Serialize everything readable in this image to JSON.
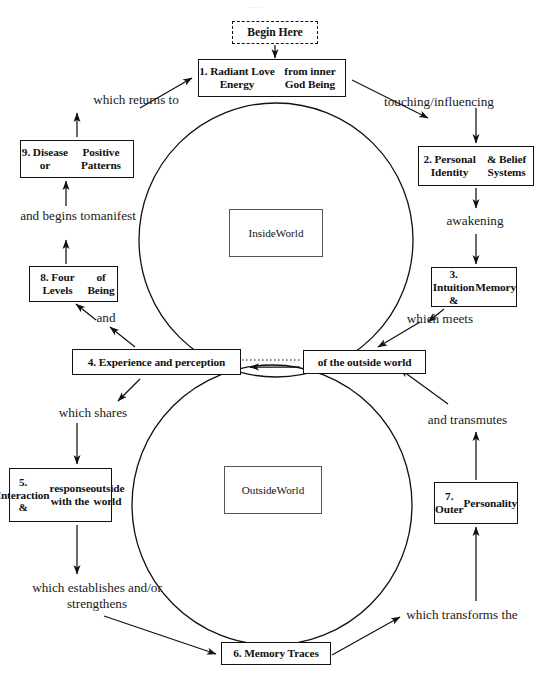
{
  "page": {
    "width": 541,
    "height": 676,
    "background": "#ffffff",
    "ink": "#111111",
    "faint_header": "....."
  },
  "diagram": {
    "type": "cycle-flow-diagram",
    "circles": [
      {
        "name": "inside-world-circle",
        "cx": 276,
        "cy": 240,
        "r": 137
      },
      {
        "name": "outside-world-circle",
        "cx": 272,
        "cy": 505,
        "r": 140
      }
    ],
    "center_labels": [
      {
        "id": "inside",
        "name": "inside-world-label",
        "text": "Inside\nWorld",
        "line1": "Inside",
        "line2": "World",
        "x": 229,
        "y": 209,
        "w": 94,
        "h": 48
      },
      {
        "id": "outside",
        "name": "outside-world-label",
        "text": "Outside\nWorld",
        "line1": "Outside",
        "line2": "World",
        "x": 224,
        "y": 466,
        "w": 98,
        "h": 48
      }
    ],
    "nodes": [
      {
        "id": "begin",
        "name": "begin-here-box",
        "label": "Begin Here",
        "style": "dashed",
        "x": 232,
        "y": 21,
        "w": 86,
        "h": 23
      },
      {
        "id": "n1",
        "name": "node-1-radiant-love-energy",
        "label": "1. Radiant Love Energy\nfrom inner God Being",
        "style": "solid",
        "x": 198,
        "y": 59,
        "w": 148,
        "h": 38
      },
      {
        "id": "n2",
        "name": "node-2-personal-identity",
        "label": "2. Personal Identity\n& Belief Systems",
        "style": "solid",
        "x": 418,
        "y": 146,
        "w": 116,
        "h": 40
      },
      {
        "id": "n3",
        "name": "node-3-intuition-memory",
        "label": "3. Intuition &\nMemory",
        "style": "solid",
        "x": 431,
        "y": 267,
        "w": 86,
        "h": 40
      },
      {
        "id": "outw",
        "name": "node-of-the-outside-world",
        "label": "of the outside world",
        "style": "solid",
        "x": 303,
        "y": 350,
        "w": 123,
        "h": 24
      },
      {
        "id": "n4",
        "name": "node-4-experience-perception",
        "label": "4. Experience and perception",
        "style": "solid",
        "x": 72,
        "y": 349,
        "w": 169,
        "h": 26
      },
      {
        "id": "n5",
        "name": "node-5-interaction-response",
        "label": "5. Interaction &\nresponse with the\noutside world",
        "style": "solid",
        "x": 9,
        "y": 468,
        "w": 103,
        "h": 54
      },
      {
        "id": "n6",
        "name": "node-6-memory-traces",
        "label": "6. Memory Traces",
        "style": "solid",
        "x": 221,
        "y": 642,
        "w": 110,
        "h": 23
      },
      {
        "id": "n7",
        "name": "node-7-outer-personality",
        "label": "7. Outer\nPersonality",
        "style": "solid",
        "x": 434,
        "y": 482,
        "w": 84,
        "h": 42
      },
      {
        "id": "n8",
        "name": "node-8-four-levels-of-being",
        "label": "8. Four Levels\nof Being",
        "style": "solid",
        "x": 29,
        "y": 266,
        "w": 89,
        "h": 36
      },
      {
        "id": "n9",
        "name": "node-9-disease-positive",
        "label": "9. Disease or\nPositive Patterns",
        "style": "solid",
        "x": 20,
        "y": 140,
        "w": 114,
        "h": 38
      }
    ],
    "connector_labels": [
      {
        "id": "c1",
        "name": "connector-label-touching-influencing",
        "text": "touching/influencing",
        "x": 364,
        "y": 94,
        "w": 150
      },
      {
        "id": "c2",
        "name": "connector-label-awakening",
        "text": "awakening",
        "x": 425,
        "y": 213,
        "w": 100
      },
      {
        "id": "c3",
        "name": "connector-label-which-meets",
        "text": "which meets",
        "x": 385,
        "y": 311,
        "w": 110
      },
      {
        "id": "c4",
        "name": "connector-label-and-transmutes",
        "text": "and transmutes",
        "x": 405,
        "y": 412,
        "w": 125
      },
      {
        "id": "c5",
        "name": "connector-label-which-transforms-the",
        "text": "which transforms the",
        "x": 382,
        "y": 607,
        "w": 160
      },
      {
        "id": "c6",
        "name": "connector-label-which-establishes",
        "text": "which establishes and/\nor strengthens",
        "x": 6,
        "y": 580,
        "w": 182
      },
      {
        "id": "c7",
        "name": "connector-label-which-shares",
        "text": "which shares",
        "x": 33,
        "y": 405,
        "w": 120
      },
      {
        "id": "c8",
        "name": "connector-label-and",
        "text": "and",
        "x": 86,
        "y": 310,
        "w": 40
      },
      {
        "id": "c9",
        "name": "connector-label-and-begins-to-manifest",
        "text": "and begins to\nmanifest",
        "x": 18,
        "y": 208,
        "w": 120
      },
      {
        "id": "c10",
        "name": "connector-label-which-returns-to",
        "text": "which returns to",
        "x": 66,
        "y": 92,
        "w": 140
      }
    ],
    "arrows": [
      {
        "name": "arrow-begin-to-node1",
        "from": "begin",
        "to": "n1"
      },
      {
        "name": "arrow-node1-to-touching",
        "from": "n1",
        "to": "c1"
      },
      {
        "name": "arrow-touching-to-node2",
        "from": "c1",
        "to": "n2"
      },
      {
        "name": "arrow-node2-to-awakening",
        "from": "n2",
        "to": "c2"
      },
      {
        "name": "arrow-awakening-to-node3",
        "from": "c2",
        "to": "n3"
      },
      {
        "name": "arrow-node3-to-which-meets",
        "from": "n3",
        "to": "c3"
      },
      {
        "name": "arrow-which-meets-to-outside",
        "from": "c3",
        "to": "outw"
      },
      {
        "name": "arrow-outside-to-node4",
        "from": "outw",
        "to": "n4"
      },
      {
        "name": "arrow-node4-to-which-shares",
        "from": "n4",
        "to": "c7"
      },
      {
        "name": "arrow-which-shares-to-node5",
        "from": "c7",
        "to": "n5"
      },
      {
        "name": "arrow-node5-to-establishes",
        "from": "n5",
        "to": "c6"
      },
      {
        "name": "arrow-establishes-to-node6",
        "from": "c6",
        "to": "n6"
      },
      {
        "name": "arrow-node6-to-transforms",
        "from": "n6",
        "to": "c5"
      },
      {
        "name": "arrow-transforms-to-node7",
        "from": "c5",
        "to": "n7"
      },
      {
        "name": "arrow-node7-to-transmutes",
        "from": "n7",
        "to": "c4"
      },
      {
        "name": "arrow-transmutes-to-outside",
        "from": "c4",
        "to": "outw"
      },
      {
        "name": "arrow-node4-to-and",
        "from": "n4",
        "to": "c8"
      },
      {
        "name": "arrow-and-to-node8",
        "from": "c8",
        "to": "n8"
      },
      {
        "name": "arrow-node8-to-manifest",
        "from": "n8",
        "to": "c9"
      },
      {
        "name": "arrow-manifest-to-node9",
        "from": "c9",
        "to": "n9"
      },
      {
        "name": "arrow-node9-to-returns",
        "from": "n9",
        "to": "c10"
      },
      {
        "name": "arrow-returns-to-node1",
        "from": "c10",
        "to": "n1"
      }
    ]
  }
}
